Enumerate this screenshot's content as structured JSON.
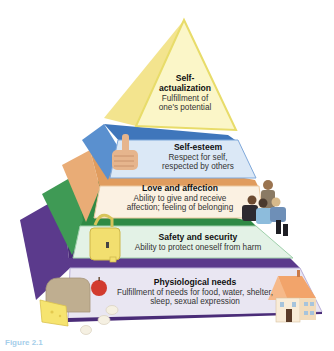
{
  "figure": {
    "caption_fragment": "Figure 2.1"
  },
  "tiers": [
    {
      "level": 5,
      "title": "Self-\nactualization",
      "title_line1": "Self-",
      "title_line2": "actualization",
      "desc_line1": "Fulfillment of",
      "desc_line2": "one's potential",
      "color": "#f6eea0",
      "edge_color": "#e8dc6a",
      "illustration": "none"
    },
    {
      "level": 4,
      "title": "Self-esteem",
      "desc_line1": "Respect for self,",
      "desc_line2": "respected by others",
      "color": "#dbe8f6",
      "edge_color": "#4f86c6",
      "illustration": "thumbs-up-hand"
    },
    {
      "level": 3,
      "title": "Love and affection",
      "desc_line1": "Ability to give and receive",
      "desc_line2": "affection; feeling of belonging",
      "color": "#fbf1e2",
      "edge_color": "#e3a56a",
      "illustration": "family-group"
    },
    {
      "level": 2,
      "title": "Safety and security",
      "desc_line1": "Ability to protect oneself from harm",
      "color": "#e3f2e6",
      "edge_color": "#3f9a55",
      "illustration": "padlock"
    },
    {
      "level": 1,
      "title": "Physiological needs",
      "desc_line1": "Fulfillment of needs for food, water, shelter,",
      "desc_line2": "sleep, sexual expression",
      "color": "#e9e6f2",
      "edge_color": "#5b3a8c",
      "illustration": "food-and-house"
    }
  ]
}
